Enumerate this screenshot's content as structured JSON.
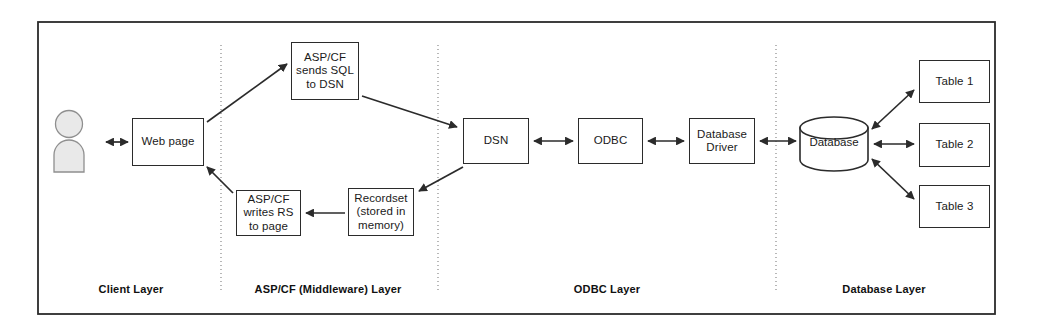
{
  "diagram": {
    "outer_frame": {
      "x": 38,
      "y": 22,
      "width": 957,
      "height": 292
    },
    "colors": {
      "stroke": "#2b2b2b",
      "divider": "#9a9a9a",
      "actor_fill": "#e8e8e8",
      "background": "#ffffff",
      "text": "#1a1a1a"
    },
    "nodes": [
      {
        "id": "web-page",
        "label": "Web page",
        "x": 132,
        "y": 118,
        "w": 72,
        "h": 48
      },
      {
        "id": "asp-send",
        "label": "ASP/CF\nsends SQL\nto DSN",
        "x": 291,
        "y": 42,
        "w": 68,
        "h": 58
      },
      {
        "id": "asp-write",
        "label": "ASP/CF\nwrites RS\nto page",
        "x": 236,
        "y": 190,
        "w": 65,
        "h": 46
      },
      {
        "id": "recordset",
        "label": "Recordset\n(stored in\nmemory)",
        "x": 348,
        "y": 188,
        "w": 66,
        "h": 48
      },
      {
        "id": "dsn",
        "label": "DSN",
        "x": 463,
        "y": 118,
        "w": 66,
        "h": 46
      },
      {
        "id": "odbc",
        "label": "ODBC",
        "x": 578,
        "y": 118,
        "w": 65,
        "h": 46
      },
      {
        "id": "db-driver",
        "label": "Database\nDriver",
        "x": 689,
        "y": 118,
        "w": 66,
        "h": 46
      },
      {
        "id": "table-1",
        "label": "Table 1",
        "x": 919,
        "y": 60,
        "w": 71,
        "h": 43
      },
      {
        "id": "table-2",
        "label": "Table 2",
        "x": 919,
        "y": 123,
        "w": 71,
        "h": 44
      },
      {
        "id": "table-3",
        "label": "Table 3",
        "x": 919,
        "y": 185,
        "w": 71,
        "h": 43
      }
    ],
    "cylinder": {
      "id": "database",
      "label": "Database",
      "x": 800,
      "y": 118,
      "w": 68,
      "h": 53
    },
    "actor": {
      "id": "user",
      "x": 55,
      "y": 110,
      "w": 46,
      "h": 62
    },
    "dividers": [
      {
        "id": "divider-client-middleware",
        "x": 221,
        "y1": 45,
        "y2": 292
      },
      {
        "id": "divider-middleware-odbc",
        "x": 438,
        "y1": 45,
        "y2": 292
      },
      {
        "id": "divider-odbc-database",
        "x": 776,
        "y1": 45,
        "y2": 292
      }
    ],
    "layer_labels": [
      {
        "id": "client-layer",
        "text": "Client Layer",
        "cx": 131,
        "y": 283
      },
      {
        "id": "middleware-layer",
        "text": "ASP/CF (Middleware) Layer",
        "cx": 328,
        "y": 283
      },
      {
        "id": "odbc-layer",
        "text": "ODBC Layer",
        "cx": 607,
        "y": 283
      },
      {
        "id": "database-layer",
        "text": "Database Layer",
        "cx": 884,
        "y": 283
      }
    ],
    "connectors": [
      {
        "id": "user-to-webpage",
        "type": "double",
        "points": "106,142 128,142"
      },
      {
        "id": "webpage-to-aspsend",
        "type": "single",
        "points": "207,122 288,64"
      },
      {
        "id": "aspsend-to-dsn",
        "type": "single",
        "points": "362,96 458,128"
      },
      {
        "id": "dsn-to-recordset",
        "type": "single",
        "points": "462,168 418,192"
      },
      {
        "id": "recordset-to-aspwrite",
        "type": "single",
        "points": "345,213 305,213"
      },
      {
        "id": "aspwrite-to-webpage",
        "type": "single",
        "points": "233,192 207,166"
      },
      {
        "id": "dsn-to-odbc",
        "type": "double",
        "points": "533,141 574,141"
      },
      {
        "id": "odbc-to-driver",
        "type": "double",
        "points": "647,141 685,141"
      },
      {
        "id": "driver-to-database",
        "type": "double",
        "points": "759,141 797,141"
      },
      {
        "id": "database-to-table1",
        "type": "double",
        "points": "873,128 915,90"
      },
      {
        "id": "database-to-table2",
        "type": "double",
        "points": "874,144 915,144"
      },
      {
        "id": "database-to-table3",
        "type": "double",
        "points": "873,160 915,200"
      }
    ]
  }
}
